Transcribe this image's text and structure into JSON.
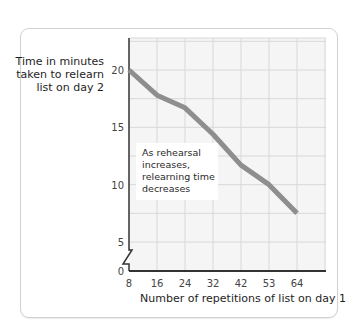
{
  "chart_data": {
    "type": "line",
    "title": "",
    "xlabel": "Number of repetitions of list on day 1",
    "ylabel": "Time in minutes taken to relearn list on day 2",
    "ylabel_lines": [
      "Time in minutes",
      "taken to relearn",
      "list on day 2"
    ],
    "categories": [
      "8",
      "16",
      "24",
      "32",
      "42",
      "53",
      "64"
    ],
    "x": [
      8,
      16,
      24,
      32,
      42,
      53,
      64
    ],
    "values": [
      20.0,
      17.8,
      16.7,
      14.4,
      11.7,
      10.0,
      7.5
    ],
    "y_ticks": [
      "0",
      "5",
      "10",
      "15",
      "20"
    ],
    "ylim": [
      0,
      22.5
    ],
    "axis_break": true,
    "grid": true,
    "legend": null,
    "annotation": {
      "text": "As rehearsal increases, relearning time decreases",
      "lines": [
        "As rehearsal",
        "increases,",
        "relearning time",
        "decreases"
      ]
    },
    "colors": {
      "line": "#8e8e8e",
      "grid": "#d8d8d8",
      "plot_bg": "#f5f5f5",
      "axis": "#333333"
    }
  }
}
